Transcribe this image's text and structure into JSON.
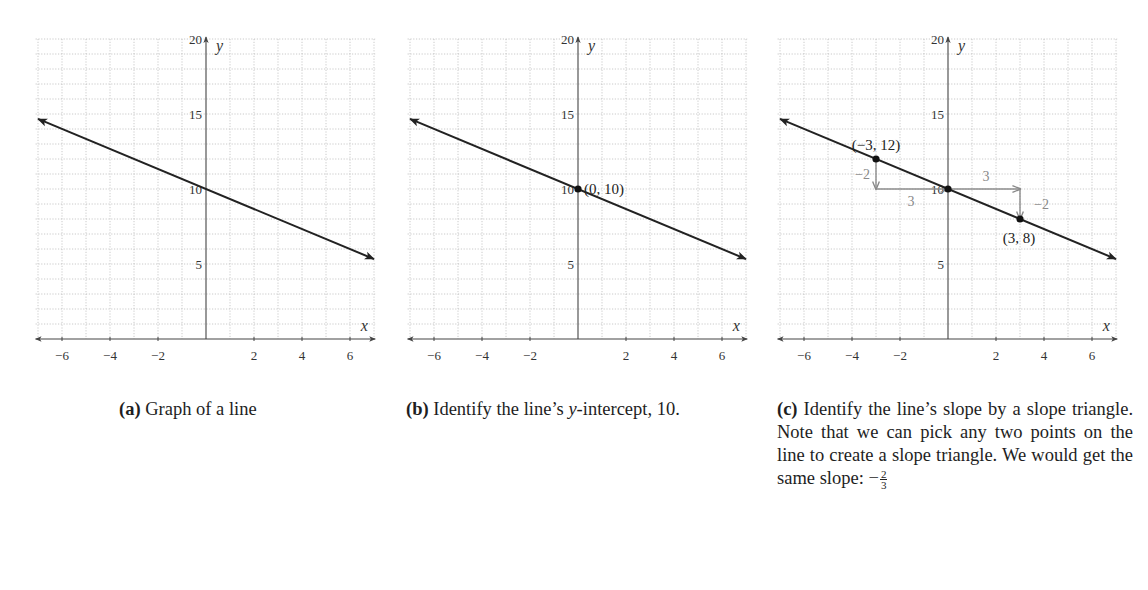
{
  "figures": [
    {
      "id": "a",
      "caption": {
        "label": "(a)",
        "text": "Graph of a line"
      },
      "origin_px": 206,
      "annotations": []
    },
    {
      "id": "b",
      "caption": {
        "label": "(b)",
        "text_before": "Identify the line’s ",
        "italic": "y",
        "text_after": "-intercept, 10."
      },
      "origin_px": 578,
      "annotations": [
        {
          "type": "point",
          "x": 0,
          "y": 10,
          "label": "(0, 10)"
        }
      ]
    },
    {
      "id": "c",
      "caption": {
        "label": "(c)",
        "text": "Identify the line’s slope by a slope triangle. Note that we can pick any two points on the line to create a slope triangle. We would get the same slope: ",
        "slope_sign": "−",
        "slope_num": "2",
        "slope_den": "3"
      },
      "origin_px": 948,
      "annotations": [
        {
          "type": "point",
          "x": -3,
          "y": 12,
          "label": "(−3, 12)"
        },
        {
          "type": "point",
          "x": 0,
          "y": 10,
          "label": ""
        },
        {
          "type": "point",
          "x": 3,
          "y": 8,
          "label": "(3, 8)"
        },
        {
          "type": "rise",
          "from": [
            -3,
            12
          ],
          "to": [
            -3,
            10
          ],
          "label": "−2"
        },
        {
          "type": "run",
          "from": [
            -3,
            10
          ],
          "to": [
            0,
            10
          ],
          "label": "3"
        },
        {
          "type": "run",
          "from": [
            0,
            10
          ],
          "to": [
            3,
            10
          ],
          "label": "3"
        },
        {
          "type": "rise",
          "from": [
            3,
            10
          ],
          "to": [
            3,
            8
          ],
          "label": "−2"
        }
      ]
    }
  ],
  "axes": {
    "x_label": "x",
    "y_label": "y",
    "x_ticks": [
      -6,
      -4,
      -2,
      2,
      4,
      6
    ],
    "x_tick_labels": [
      "−6",
      "−4",
      "−2",
      "2",
      "4",
      "6"
    ],
    "y_ticks": [
      5,
      10,
      15,
      20
    ],
    "y_tick_labels": [
      "5",
      "10",
      "15",
      "20"
    ]
  },
  "chart_data": [
    {
      "type": "line",
      "title": "(a) Graph of a line",
      "xlabel": "x",
      "ylabel": "y",
      "xlim": [
        -7,
        7
      ],
      "ylim": [
        0,
        20
      ],
      "grid": true,
      "series": [
        {
          "name": "y = -2/3 x + 10",
          "x": [
            -7,
            7
          ],
          "y": [
            14.67,
            5.33
          ]
        }
      ]
    },
    {
      "type": "line",
      "title": "(b) Identify the line's y-intercept, 10.",
      "xlabel": "x",
      "ylabel": "y",
      "xlim": [
        -7,
        7
      ],
      "ylim": [
        0,
        20
      ],
      "grid": true,
      "series": [
        {
          "name": "y = -2/3 x + 10",
          "x": [
            -7,
            7
          ],
          "y": [
            14.67,
            5.33
          ]
        }
      ],
      "points": [
        {
          "x": 0,
          "y": 10,
          "label": "(0, 10)"
        }
      ]
    },
    {
      "type": "line",
      "title": "(c) Identify the line's slope by a slope triangle.",
      "xlabel": "x",
      "ylabel": "y",
      "xlim": [
        -7,
        7
      ],
      "ylim": [
        0,
        20
      ],
      "grid": true,
      "series": [
        {
          "name": "y = -2/3 x + 10",
          "x": [
            -7,
            7
          ],
          "y": [
            14.67,
            5.33
          ]
        }
      ],
      "points": [
        {
          "x": -3,
          "y": 12,
          "label": "(−3, 12)"
        },
        {
          "x": 0,
          "y": 10,
          "label": ""
        },
        {
          "x": 3,
          "y": 8,
          "label": "(3, 8)"
        }
      ],
      "slope_triangle": {
        "rise": -2,
        "run": 3,
        "slope": "-2/3"
      }
    }
  ]
}
